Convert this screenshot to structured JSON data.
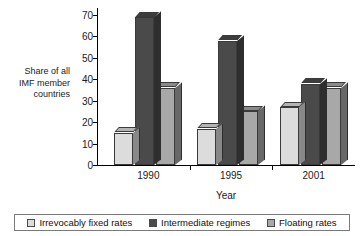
{
  "chart_data": {
    "type": "bar",
    "title": "",
    "xlabel": "Year",
    "ylabel": "Share of  all\nIMF member\ncountries",
    "categories": [
      "1990",
      "1995",
      "2001"
    ],
    "series": [
      {
        "name": "Irrevocably fixed rates",
        "color": "#dcdcdc",
        "values": [
          15,
          17,
          27
        ]
      },
      {
        "name": "Intermediate regimes",
        "color": "#4a4a4a",
        "values": [
          69,
          58,
          38
        ]
      },
      {
        "name": "Floating rates",
        "color": "#a8a8a8",
        "values": [
          36,
          25,
          36
        ]
      }
    ],
    "ylim": [
      0,
      70
    ],
    "yticks": [
      0,
      10,
      20,
      30,
      40,
      50,
      60,
      70
    ],
    "ytick_labels": [
      "0",
      "10",
      "20",
      "30",
      "40",
      "50",
      "60",
      "70"
    ],
    "grid": false,
    "legend_position": "bottom",
    "style": "3d-grouped-bars"
  },
  "axis": {
    "y_title": "Share of  all\nIMF member\ncountries",
    "x_title": "Year"
  },
  "legend": {
    "items": [
      {
        "label": "Irrevocably fixed rates",
        "color": "#dcdcdc"
      },
      {
        "label": "Intermediate regimes",
        "color": "#4a4a4a"
      },
      {
        "label": "Floating rates",
        "color": "#a8a8a8"
      }
    ]
  }
}
